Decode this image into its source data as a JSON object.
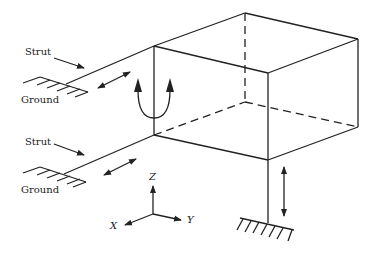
{
  "diagram": {
    "type": "mechanical-support-schematic",
    "labels": {
      "strut_upper": "Strut",
      "ground_upper": "Ground",
      "strut_lower": "Strut",
      "ground_lower": "Ground"
    },
    "axes": {
      "z": "Z",
      "x": "X",
      "y": "Y"
    },
    "colors": {
      "line": "#222222",
      "background": "#ffffff"
    }
  }
}
